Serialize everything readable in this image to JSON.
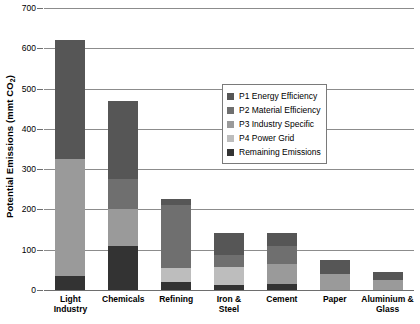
{
  "chart_data": {
    "type": "bar",
    "subtype": "stacked-bar",
    "title": "",
    "xlabel": "",
    "ylabel": "Potential Emissions (mmt CO2)",
    "ylabel_main": "Potential Emissions (mmt CO",
    "ylabel_sub": "2",
    "ylabel_tail": ")",
    "ylim": [
      0,
      700
    ],
    "ytick_step": 100,
    "yticks": [
      0,
      100,
      200,
      300,
      400,
      500,
      600,
      700
    ],
    "ytick_labels": [
      "0",
      "100",
      "200",
      "300",
      "400",
      "500",
      "600",
      "700"
    ],
    "grid": true,
    "grid_axis": "y",
    "legend_position": "upper-right-inside",
    "categories": [
      "Light Industry",
      "Chemicals",
      "Refining",
      "Iron & Steel",
      "Cement",
      "Paper",
      "Aluminium & Glass"
    ],
    "category_label_lines": [
      [
        "Light",
        "Industry"
      ],
      [
        "Chemicals"
      ],
      [
        "Refining"
      ],
      [
        "Iron &",
        "Steel"
      ],
      [
        "Cement"
      ],
      [
        "Paper"
      ],
      [
        "Aluminium &",
        "Glass"
      ]
    ],
    "stack_order_bottom_to_top": [
      "Remaining Emissions",
      "P4 Power Grid",
      "P3 Industry Specific",
      "P2 Material Efficiency",
      "P1 Energy Efficiency"
    ],
    "series": [
      {
        "name": "P1 Energy Efficiency",
        "color": "#565656",
        "values": [
          295,
          195,
          15,
          55,
          32,
          35,
          20
        ]
      },
      {
        "name": "P2 Material Efficiency",
        "color": "#6f6f6f",
        "values": [
          0,
          75,
          155,
          30,
          45,
          0,
          0
        ]
      },
      {
        "name": "P3 Industry Specific",
        "color": "#9a9a9a",
        "values": [
          290,
          90,
          0,
          0,
          50,
          40,
          25
        ]
      },
      {
        "name": "P4 Power Grid",
        "color": "#bdbdbd",
        "values": [
          0,
          0,
          35,
          45,
          0,
          0,
          0
        ]
      },
      {
        "name": "Remaining Emissions",
        "color": "#333333",
        "values": [
          35,
          110,
          20,
          12,
          15,
          0,
          0
        ]
      }
    ],
    "totals": [
      620,
      470,
      225,
      142,
      142,
      75,
      45
    ]
  },
  "legend": {
    "items": [
      {
        "label": "P1 Energy Efficiency",
        "color": "#565656"
      },
      {
        "label": "P2 Material Efficiency",
        "color": "#6f6f6f"
      },
      {
        "label": "P3 Industry Specific",
        "color": "#9a9a9a"
      },
      {
        "label": "P4 Power Grid",
        "color": "#bdbdbd"
      },
      {
        "label": "Remaining Emissions",
        "color": "#333333"
      }
    ]
  },
  "axes": {
    "y_title": "Potential Emissions (mmt CO",
    "y_title_sub": "2",
    "y_title_close": ")"
  }
}
